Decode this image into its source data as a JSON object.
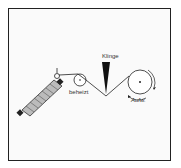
{
  "diagram": {
    "labels": {
      "blade": "Klinge",
      "heated": "beheizt",
      "winder": "Aufw."
    },
    "colors": {
      "ink": "#222222",
      "background": "#fafafa"
    }
  }
}
